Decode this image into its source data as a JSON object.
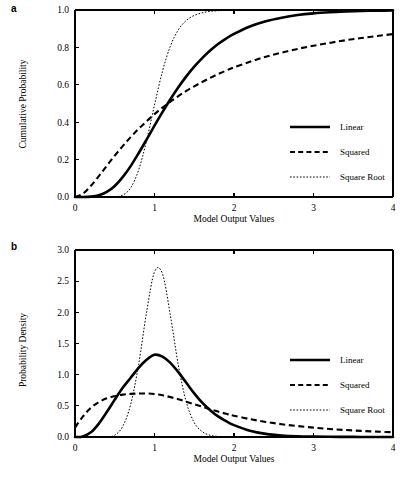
{
  "figure": {
    "panels": [
      {
        "tag": "a",
        "ylabel": "Cumulative Probability",
        "xlabel": "Model Output Values"
      },
      {
        "tag": "b",
        "ylabel": "Probability Density",
        "xlabel": "Model Output Values"
      }
    ],
    "legend": {
      "items": [
        {
          "label": "Linear",
          "style": "solid"
        },
        {
          "label": "Squared",
          "style": "dashed"
        },
        {
          "label": "Square Root",
          "style": "dotted"
        }
      ]
    }
  },
  "chart_data": [
    {
      "type": "line",
      "panel": "a",
      "title": "",
      "xlabel": "Model Output Values",
      "ylabel": "Cumulative Probability",
      "xlim": [
        0,
        4
      ],
      "ylim": [
        0,
        1
      ],
      "xticks": [
        0,
        1,
        2,
        3,
        4
      ],
      "xticklabels": [
        "0",
        "1",
        "2",
        "3",
        "4"
      ],
      "yticks": [
        0.0,
        0.2,
        0.4,
        0.6,
        0.8,
        1.0
      ],
      "yticklabels": [
        "0.0",
        "0.2",
        "0.4",
        "0.6",
        "0.8",
        "1.0"
      ],
      "grid": false,
      "legend_position": "center-right",
      "x": [
        0.0,
        0.1,
        0.2,
        0.3,
        0.4,
        0.5,
        0.6,
        0.7,
        0.8,
        0.9,
        1.0,
        1.1,
        1.2,
        1.3,
        1.4,
        1.5,
        1.6,
        1.7,
        1.8,
        1.9,
        2.0,
        2.2,
        2.4,
        2.6,
        2.8,
        3.0,
        3.2,
        3.4,
        3.6,
        3.8,
        4.0
      ],
      "series": [
        {
          "name": "Linear",
          "values": [
            0.0,
            0.0,
            0.002,
            0.009,
            0.027,
            0.059,
            0.106,
            0.165,
            0.234,
            0.307,
            0.382,
            0.454,
            0.523,
            0.587,
            0.645,
            0.697,
            0.743,
            0.783,
            0.818,
            0.847,
            0.872,
            0.912,
            0.94,
            0.959,
            0.973,
            0.982,
            0.988,
            0.992,
            0.995,
            0.996,
            0.998
          ]
        },
        {
          "name": "Squared",
          "values": [
            0.0,
            0.018,
            0.06,
            0.112,
            0.167,
            0.221,
            0.272,
            0.32,
            0.364,
            0.405,
            0.443,
            0.478,
            0.51,
            0.54,
            0.567,
            0.592,
            0.615,
            0.637,
            0.657,
            0.676,
            0.693,
            0.723,
            0.75,
            0.772,
            0.792,
            0.809,
            0.824,
            0.838,
            0.85,
            0.861,
            0.871
          ]
        },
        {
          "name": "Square Root",
          "values": [
            0.0,
            0.0,
            0.0,
            0.0,
            0.0,
            0.001,
            0.01,
            0.049,
            0.144,
            0.301,
            0.492,
            0.672,
            0.807,
            0.894,
            0.944,
            0.971,
            0.985,
            0.993,
            0.996,
            0.998,
            0.999,
            1.0,
            1.0,
            1.0,
            1.0,
            1.0,
            1.0,
            1.0,
            1.0,
            1.0,
            1.0
          ]
        }
      ],
      "note": "All three CDFs intersect near x = 1, y = 0.5"
    },
    {
      "type": "line",
      "panel": "b",
      "title": "",
      "xlabel": "Model Output Values",
      "ylabel": "Probability Density",
      "xlim": [
        0,
        4
      ],
      "ylim": [
        0,
        3
      ],
      "xticks": [
        0,
        1,
        2,
        3,
        4
      ],
      "xticklabels": [
        "0",
        "1",
        "2",
        "3",
        "4"
      ],
      "yticks": [
        0.0,
        0.5,
        1.0,
        1.5,
        2.0,
        2.5,
        3.0
      ],
      "yticklabels": [
        "0.0",
        "0.5",
        "1.0",
        "1.5",
        "2.0",
        "2.5",
        "3.0"
      ],
      "grid": false,
      "legend_position": "center-right",
      "x": [
        0.0,
        0.1,
        0.2,
        0.3,
        0.4,
        0.5,
        0.6,
        0.7,
        0.8,
        0.9,
        1.0,
        1.1,
        1.2,
        1.3,
        1.4,
        1.5,
        1.6,
        1.7,
        1.8,
        1.9,
        2.0,
        2.2,
        2.4,
        2.6,
        2.8,
        3.0,
        3.2,
        3.4,
        3.6,
        3.8,
        4.0
      ],
      "series": [
        {
          "name": "Linear",
          "values": [
            0.0,
            0.01,
            0.075,
            0.215,
            0.4,
            0.6,
            0.79,
            0.95,
            1.11,
            1.24,
            1.32,
            1.29,
            1.19,
            1.04,
            0.87,
            0.7,
            0.55,
            0.43,
            0.33,
            0.255,
            0.19,
            0.1,
            0.05,
            0.025,
            0.012,
            0.006,
            0.003,
            0.002,
            0.001,
            0.0,
            0.0
          ],
          "peak": {
            "x": 1.0,
            "y": 1.32
          }
        },
        {
          "name": "Squared",
          "values": [
            0.15,
            0.33,
            0.47,
            0.56,
            0.62,
            0.655,
            0.68,
            0.692,
            0.697,
            0.698,
            0.69,
            0.67,
            0.64,
            0.605,
            0.565,
            0.525,
            0.485,
            0.445,
            0.408,
            0.373,
            0.342,
            0.287,
            0.242,
            0.205,
            0.175,
            0.15,
            0.129,
            0.112,
            0.098,
            0.086,
            0.076
          ],
          "peak": {
            "x": 0.9,
            "y": 0.7
          }
        },
        {
          "name": "Square Root",
          "values": [
            0.0,
            0.0,
            0.0,
            0.0,
            0.002,
            0.03,
            0.17,
            0.52,
            1.16,
            2.0,
            2.65,
            2.62,
            1.95,
            1.15,
            0.56,
            0.23,
            0.085,
            0.028,
            0.009,
            0.003,
            0.001,
            0.0,
            0.0,
            0.0,
            0.0,
            0.0,
            0.0,
            0.0,
            0.0,
            0.0,
            0.0
          ],
          "peak": {
            "x": 1.02,
            "y": 2.68
          }
        }
      ],
      "note": "Square Root density is tall and narrow; Squared density is broad with a long right tail"
    }
  ]
}
